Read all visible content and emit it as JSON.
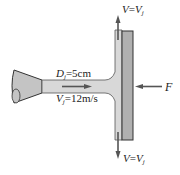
{
  "diagram": {
    "type": "jet impinging on flat plate",
    "labels": {
      "top_velocity": {
        "var": "V",
        "eq": "=",
        "rhs": "V",
        "sub": "j"
      },
      "bottom_velocity": {
        "var": "V",
        "eq": "=",
        "rhs": "V",
        "sub": "j"
      },
      "diameter": {
        "var": "D",
        "sub": "j",
        "value": "=5cm"
      },
      "jet_velocity": {
        "var": "V",
        "sub": "j",
        "value": "=12m/s"
      },
      "force": "F"
    },
    "colors": {
      "fluid": "#d8d8d8",
      "plate": "#b0b0b0",
      "outline": "#333333",
      "arrow": "#555555"
    }
  }
}
